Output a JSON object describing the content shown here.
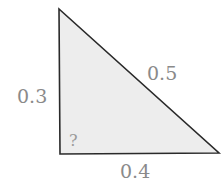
{
  "diagram": {
    "type": "right-triangle",
    "colors": {
      "fill": "#ededed",
      "stroke": "#2a2a2a",
      "label": "#8a8a8a"
    },
    "vertices": {
      "top": [
        59,
        9
      ],
      "bottom_left": [
        60,
        154
      ],
      "bottom_right": [
        219,
        153
      ]
    },
    "sides": {
      "vertical_leg": {
        "label": "0.3"
      },
      "horizontal_leg": {
        "label": "0.4"
      },
      "hypotenuse": {
        "label": "0.5"
      }
    },
    "angle_marker": {
      "label": "?"
    }
  }
}
